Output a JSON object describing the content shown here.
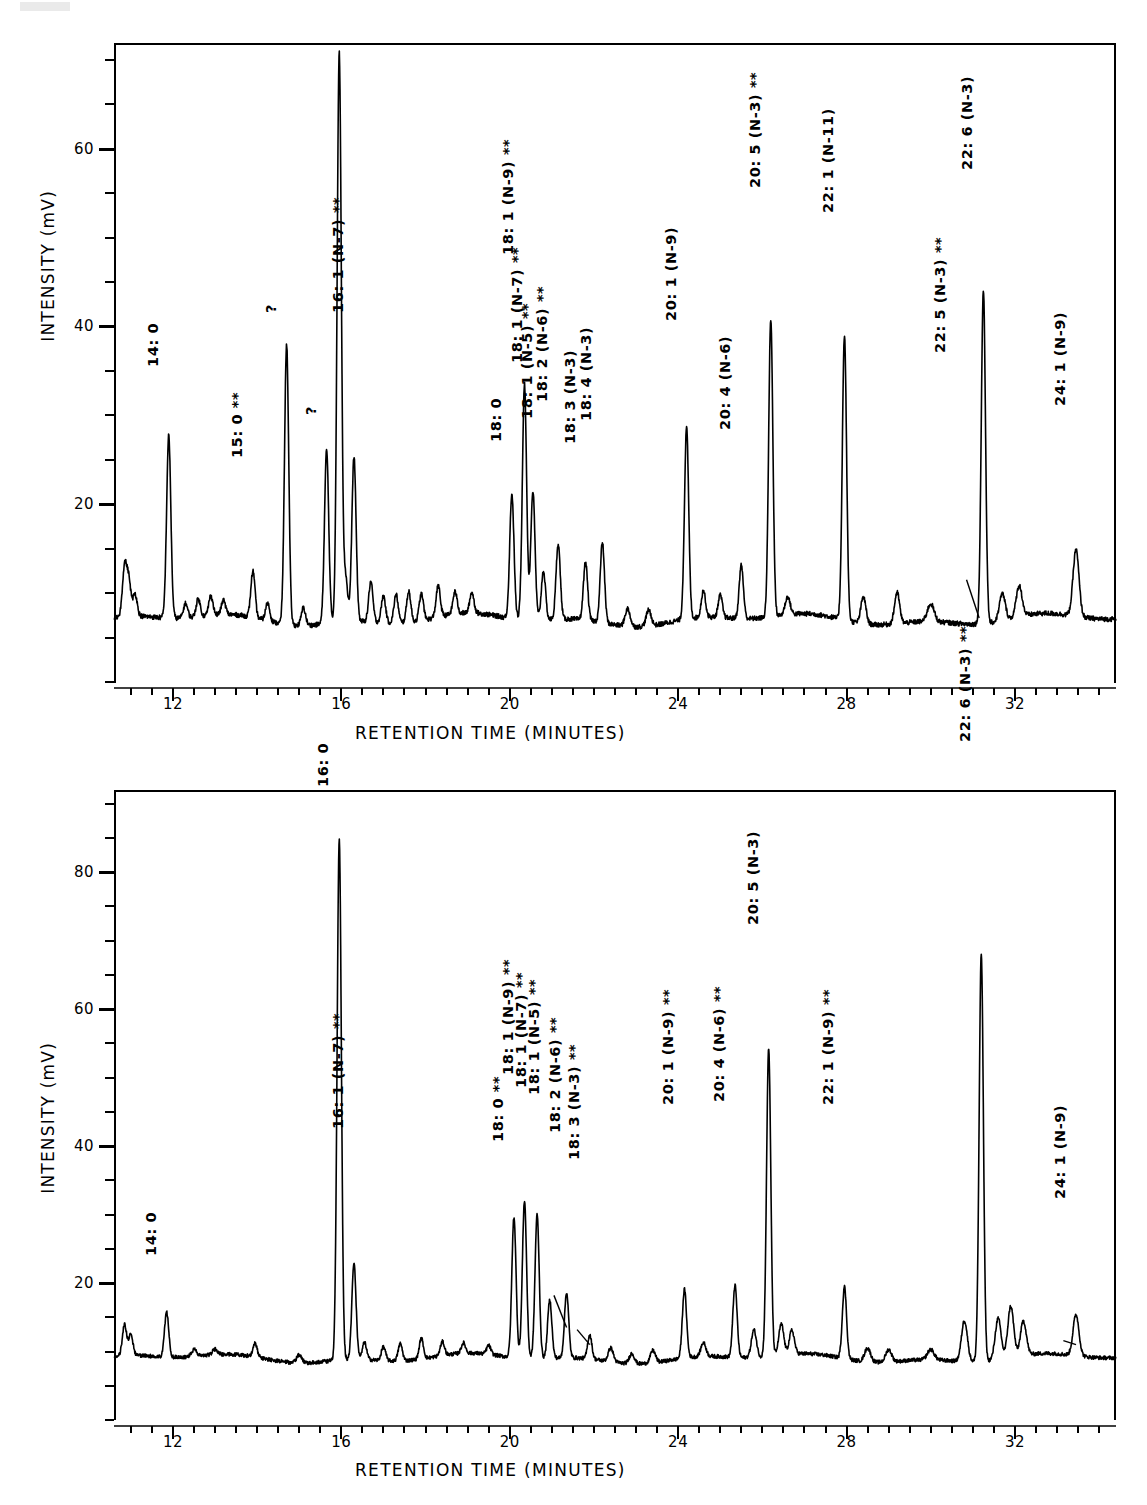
{
  "figure": {
    "panels": [
      {
        "id": "top",
        "axis": {
          "ylabel": "INTENSITY  (mV)",
          "xlabel": "RETENTION TIME  (MINUTES)",
          "yticks": [
            "20",
            "40",
            "60"
          ],
          "xticks": [
            "12",
            "16",
            "20",
            "24",
            "28",
            "32"
          ],
          "ylim": [
            0,
            72
          ],
          "xlim": [
            10.6,
            34.4
          ]
        },
        "peak_labels": [
          {
            "text": "14: 0",
            "rt": 11.9,
            "label_y": 30.5
          },
          {
            "text": "15: 0  **",
            "rt": 13.9,
            "label_y": 17.8
          },
          {
            "text": "?",
            "rt": 14.7,
            "label_y": 40.5
          },
          {
            "text": "?",
            "rt": 15.65,
            "label_y": 29.0
          },
          {
            "text": "16: 0  **",
            "rt": 15.95,
            "label_y": 70.5
          },
          {
            "text": "16: 1  (N-7)  **",
            "rt": 16.3,
            "label_y": 28.5
          },
          {
            "text": "18: 0",
            "rt": 20.05,
            "label_y": 22.0
          },
          {
            "text": "18: 1  (N-9)  **",
            "rt": 20.35,
            "label_y": 35.0
          },
          {
            "text": "18: 1  (N-7)  **",
            "rt": 20.55,
            "label_y": 22.8
          },
          {
            "text": "18: 1  (N-5)  **",
            "rt": 20.8,
            "label_y": 16.5
          },
          {
            "text": "18: 2  (N-6)  **",
            "rt": 21.15,
            "label_y": 18.5
          },
          {
            "text": "18: 3  (N-3)",
            "rt": 21.8,
            "label_y": 16.2
          },
          {
            "text": "18: 4  (N-3)",
            "rt": 22.2,
            "label_y": 18.8
          },
          {
            "text": "20: 1  (N-9)",
            "rt": 24.2,
            "label_y": 30.0
          },
          {
            "text": "20: 4  (N-6)",
            "rt": 25.5,
            "label_y": 17.8
          },
          {
            "text": "20: 5  (N-3)  **",
            "rt": 26.2,
            "label_y": 42.5
          },
          {
            "text": "22: 1  (N-11)",
            "rt": 27.95,
            "label_y": 41.0
          },
          {
            "text": "22: 5  (N-3)  **",
            "rt": 30.6,
            "label_y": 24.0
          },
          {
            "text": "22: 6  (N-3)",
            "rt": 31.25,
            "label_y": 47.0
          },
          {
            "text": "24: 1  (N-9)",
            "rt": 33.45,
            "label_y": 20.5
          }
        ],
        "leader": {
          "from_rt": 30.85,
          "from_y": 11.5,
          "to_rt": 31.15,
          "to_y": 7.2
        }
      },
      {
        "id": "bottom",
        "axis": {
          "ylabel": "INTENSITY  (mV)",
          "xlabel": "RETENTION TIME  (MINUTES)",
          "yticks": [
            "20",
            "40",
            "60",
            "80"
          ],
          "xticks": [
            "12",
            "16",
            "20",
            "24",
            "28",
            "32"
          ],
          "ylim": [
            0,
            92
          ],
          "xlim": [
            10.6,
            34.4
          ]
        },
        "peak_labels": [
          {
            "text": "14: 0",
            "rt": 11.85,
            "label_y": 17.5
          },
          {
            "text": "16: 0",
            "rt": 15.95,
            "label_y": 86.0
          },
          {
            "text": "16: 1  (N-7)  **",
            "rt": 16.3,
            "label_y": 25.5
          },
          {
            "text": "18: 0  **",
            "rt": 20.1,
            "label_y": 31.0
          },
          {
            "text": "18: 1  (N-9)  **",
            "rt": 20.35,
            "label_y": 33.5
          },
          {
            "text": "18: 1  (N-7)  **",
            "rt": 20.65,
            "label_y": 31.5
          },
          {
            "text": "18: 1  (N-5)  **",
            "rt": 20.95,
            "label_y": 30.5
          },
          {
            "text": "18: 2  (N-6)  **",
            "rt": 21.45,
            "label_y": 25.0
          },
          {
            "text": "18: 3  (N-3)  **",
            "rt": 21.9,
            "label_y": 21.0
          },
          {
            "text": "20: 1  (N-9)  **",
            "rt": 24.15,
            "label_y": 29.0
          },
          {
            "text": "20: 4  (N-6)  **",
            "rt": 25.35,
            "label_y": 29.5
          },
          {
            "text": "20: 5  (N-3)",
            "rt": 26.15,
            "label_y": 58.5
          },
          {
            "text": "22: 1  (N-9)  **",
            "rt": 27.95,
            "label_y": 29.0
          },
          {
            "text": "22: 6  (N-3)  **",
            "rt": 31.2,
            "label_y": 82.0
          },
          {
            "text": "24: 1  (N-9)",
            "rt": 33.45,
            "label_y": 18.5
          }
        ],
        "leaders": [
          {
            "from_rt": 21.05,
            "from_y": 18.2,
            "to_rt": 21.35,
            "to_y": 13.5
          },
          {
            "from_rt": 21.6,
            "from_y": 13.2,
            "to_rt": 21.9,
            "to_y": 11.0
          },
          {
            "from_rt": 33.15,
            "from_y": 11.6,
            "to_rt": 33.45,
            "to_y": 11.0
          }
        ]
      }
    ]
  },
  "chart_data": {
    "type": "line",
    "xlabel": "RETENTION TIME  (MINUTES)",
    "ylabel": "INTENSITY  (mV)",
    "series": [
      {
        "name": "top-chromatogram",
        "xlim": [
          10.6,
          34.4
        ],
        "ylim": [
          0,
          72
        ],
        "baseline": 7.0,
        "peaks": [
          {
            "rt": 10.85,
            "height": 12.5,
            "width": 0.05,
            "label": ""
          },
          {
            "rt": 10.95,
            "height": 11.0,
            "width": 0.05,
            "label": ""
          },
          {
            "rt": 11.1,
            "height": 9.5,
            "width": 0.05,
            "label": ""
          },
          {
            "rt": 11.9,
            "height": 27.5,
            "width": 0.05,
            "label": "14: 0"
          },
          {
            "rt": 12.3,
            "height": 8.6,
            "width": 0.05,
            "label": ""
          },
          {
            "rt": 12.6,
            "height": 9.0,
            "width": 0.05,
            "label": ""
          },
          {
            "rt": 12.9,
            "height": 9.2,
            "width": 0.05,
            "label": ""
          },
          {
            "rt": 13.2,
            "height": 8.6,
            "width": 0.05,
            "label": ""
          },
          {
            "rt": 13.9,
            "height": 12.2,
            "width": 0.05,
            "label": "15: 0  **"
          },
          {
            "rt": 14.25,
            "height": 9.0,
            "width": 0.05,
            "label": ""
          },
          {
            "rt": 14.7,
            "height": 38.5,
            "width": 0.05,
            "label": "?"
          },
          {
            "rt": 15.1,
            "height": 9.0,
            "width": 0.05,
            "label": ""
          },
          {
            "rt": 15.65,
            "height": 26.5,
            "width": 0.05,
            "label": "?"
          },
          {
            "rt": 15.95,
            "height": 71.0,
            "width": 0.05,
            "label": "16: 0  **"
          },
          {
            "rt": 16.1,
            "height": 12.0,
            "width": 0.05,
            "label": ""
          },
          {
            "rt": 16.3,
            "height": 25.5,
            "width": 0.05,
            "label": "16: 1  (N-7)  **"
          },
          {
            "rt": 16.7,
            "height": 11.5,
            "width": 0.05,
            "label": ""
          },
          {
            "rt": 17.0,
            "height": 10.0,
            "width": 0.05,
            "label": ""
          },
          {
            "rt": 17.3,
            "height": 10.2,
            "width": 0.05,
            "label": ""
          },
          {
            "rt": 17.6,
            "height": 10.5,
            "width": 0.05,
            "label": ""
          },
          {
            "rt": 17.9,
            "height": 10.0,
            "width": 0.05,
            "label": ""
          },
          {
            "rt": 18.3,
            "height": 10.5,
            "width": 0.05,
            "label": ""
          },
          {
            "rt": 18.7,
            "height": 9.5,
            "width": 0.05,
            "label": ""
          },
          {
            "rt": 19.1,
            "height": 9.3,
            "width": 0.05,
            "label": ""
          },
          {
            "rt": 20.05,
            "height": 21.0,
            "width": 0.05,
            "label": "18: 0"
          },
          {
            "rt": 20.35,
            "height": 33.5,
            "width": 0.05,
            "label": "18: 1  (N-9)  **"
          },
          {
            "rt": 20.55,
            "height": 21.5,
            "width": 0.05,
            "label": "18: 1  (N-7)  **"
          },
          {
            "rt": 20.8,
            "height": 12.5,
            "width": 0.05,
            "label": "18: 1  (N-5)  **"
          },
          {
            "rt": 21.15,
            "height": 15.5,
            "width": 0.05,
            "label": "18: 2  (N-6)  **"
          },
          {
            "rt": 21.8,
            "height": 13.5,
            "width": 0.05,
            "label": "18: 3  (N-3)"
          },
          {
            "rt": 22.2,
            "height": 16.0,
            "width": 0.05,
            "label": "18: 4  (N-3)"
          },
          {
            "rt": 22.8,
            "height": 9.0,
            "width": 0.06,
            "label": ""
          },
          {
            "rt": 23.3,
            "height": 8.8,
            "width": 0.06,
            "label": ""
          },
          {
            "rt": 24.2,
            "height": 28.5,
            "width": 0.05,
            "label": "20: 1  (N-9)"
          },
          {
            "rt": 24.6,
            "height": 10.0,
            "width": 0.05,
            "label": ""
          },
          {
            "rt": 25.0,
            "height": 9.5,
            "width": 0.05,
            "label": ""
          },
          {
            "rt": 25.5,
            "height": 13.0,
            "width": 0.05,
            "label": "20: 4  (N-6)"
          },
          {
            "rt": 26.2,
            "height": 40.5,
            "width": 0.05,
            "label": "20: 5  (N-3)  **"
          },
          {
            "rt": 26.6,
            "height": 9.0,
            "width": 0.06,
            "label": ""
          },
          {
            "rt": 27.95,
            "height": 39.0,
            "width": 0.05,
            "label": "22: 1  (N-11)"
          },
          {
            "rt": 28.4,
            "height": 10.0,
            "width": 0.06,
            "label": ""
          },
          {
            "rt": 29.2,
            "height": 10.5,
            "width": 0.06,
            "label": ""
          },
          {
            "rt": 30.0,
            "height": 9.0,
            "width": 0.08,
            "label": ""
          },
          {
            "rt": 31.25,
            "height": 44.5,
            "width": 0.05,
            "label": "22: 6  (N-3)"
          },
          {
            "rt": 31.7,
            "height": 10.0,
            "width": 0.07,
            "label": ""
          },
          {
            "rt": 32.1,
            "height": 10.5,
            "width": 0.07,
            "label": ""
          },
          {
            "rt": 33.45,
            "height": 14.5,
            "width": 0.07,
            "label": "24: 1  (N-9)"
          }
        ]
      },
      {
        "name": "bottom-chromatogram",
        "xlim": [
          10.6,
          34.4
        ],
        "ylim": [
          0,
          92
        ],
        "baseline": 9.0,
        "peaks": [
          {
            "rt": 10.85,
            "height": 13.5,
            "width": 0.05,
            "label": ""
          },
          {
            "rt": 11.0,
            "height": 12.0,
            "width": 0.05,
            "label": ""
          },
          {
            "rt": 11.85,
            "height": 15.5,
            "width": 0.05,
            "label": "14: 0"
          },
          {
            "rt": 12.5,
            "height": 10.0,
            "width": 0.06,
            "label": ""
          },
          {
            "rt": 13.0,
            "height": 9.8,
            "width": 0.06,
            "label": ""
          },
          {
            "rt": 13.95,
            "height": 11.0,
            "width": 0.05,
            "label": ""
          },
          {
            "rt": 15.0,
            "height": 10.2,
            "width": 0.06,
            "label": ""
          },
          {
            "rt": 15.95,
            "height": 85.0,
            "width": 0.05,
            "label": "16: 0"
          },
          {
            "rt": 16.3,
            "height": 23.0,
            "width": 0.05,
            "label": "16: 1  (N-7)  **"
          },
          {
            "rt": 16.55,
            "height": 11.5,
            "width": 0.05,
            "label": ""
          },
          {
            "rt": 17.0,
            "height": 11.0,
            "width": 0.05,
            "label": ""
          },
          {
            "rt": 17.4,
            "height": 11.5,
            "width": 0.05,
            "label": ""
          },
          {
            "rt": 17.9,
            "height": 12.0,
            "width": 0.05,
            "label": ""
          },
          {
            "rt": 18.4,
            "height": 11.0,
            "width": 0.05,
            "label": ""
          },
          {
            "rt": 18.9,
            "height": 10.5,
            "width": 0.05,
            "label": ""
          },
          {
            "rt": 19.5,
            "height": 10.3,
            "width": 0.05,
            "label": ""
          },
          {
            "rt": 20.1,
            "height": 29.5,
            "width": 0.05,
            "label": "18: 0  **"
          },
          {
            "rt": 20.35,
            "height": 32.0,
            "width": 0.05,
            "label": "18: 1  (N-9)  **"
          },
          {
            "rt": 20.65,
            "height": 30.0,
            "width": 0.05,
            "label": "18: 1  (N-7)  **"
          },
          {
            "rt": 20.95,
            "height": 17.5,
            "width": 0.05,
            "label": "18: 1  (N-5)  **"
          },
          {
            "rt": 21.35,
            "height": 18.5,
            "width": 0.05,
            "label": "18: 2  (N-6)  **"
          },
          {
            "rt": 21.9,
            "height": 12.5,
            "width": 0.05,
            "label": "18: 3  (N-3)  **"
          },
          {
            "rt": 22.4,
            "height": 11.0,
            "width": 0.06,
            "label": ""
          },
          {
            "rt": 22.9,
            "height": 10.5,
            "width": 0.06,
            "label": ""
          },
          {
            "rt": 23.4,
            "height": 10.8,
            "width": 0.06,
            "label": ""
          },
          {
            "rt": 24.15,
            "height": 19.0,
            "width": 0.05,
            "label": "20: 1  (N-9)  **"
          },
          {
            "rt": 24.6,
            "height": 11.0,
            "width": 0.06,
            "label": ""
          },
          {
            "rt": 25.35,
            "height": 19.5,
            "width": 0.05,
            "label": "20: 4  (N-6)  **"
          },
          {
            "rt": 25.8,
            "height": 13.0,
            "width": 0.06,
            "label": ""
          },
          {
            "rt": 26.15,
            "height": 54.0,
            "width": 0.05,
            "label": "20: 5  (N-3)"
          },
          {
            "rt": 26.45,
            "height": 13.5,
            "width": 0.06,
            "label": ""
          },
          {
            "rt": 26.7,
            "height": 12.5,
            "width": 0.06,
            "label": ""
          },
          {
            "rt": 27.95,
            "height": 19.5,
            "width": 0.05,
            "label": "22: 1  (N-9)  **"
          },
          {
            "rt": 28.5,
            "height": 11.0,
            "width": 0.07,
            "label": ""
          },
          {
            "rt": 29.0,
            "height": 10.8,
            "width": 0.07,
            "label": ""
          },
          {
            "rt": 30.0,
            "height": 10.5,
            "width": 0.08,
            "label": ""
          },
          {
            "rt": 30.8,
            "height": 15.0,
            "width": 0.07,
            "label": ""
          },
          {
            "rt": 31.2,
            "height": 68.5,
            "width": 0.05,
            "label": "22: 6  (N-3)  **"
          },
          {
            "rt": 31.6,
            "height": 15.0,
            "width": 0.07,
            "label": ""
          },
          {
            "rt": 31.9,
            "height": 16.5,
            "width": 0.07,
            "label": ""
          },
          {
            "rt": 32.2,
            "height": 14.0,
            "width": 0.07,
            "label": ""
          },
          {
            "rt": 33.45,
            "height": 15.0,
            "width": 0.07,
            "label": "24: 1  (N-9)"
          }
        ]
      }
    ]
  }
}
